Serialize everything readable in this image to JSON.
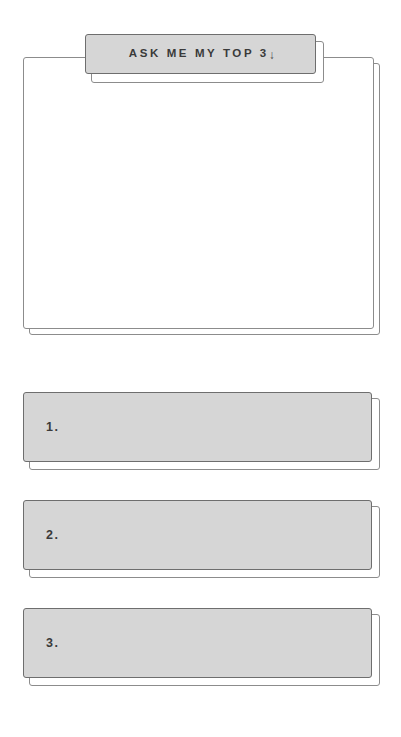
{
  "page": {
    "background_color": "#ffffff",
    "fill_color": "#d6d6d6",
    "border_color": "#6e6e6e",
    "text_color": "#3a3a3a"
  },
  "header_tab": {
    "label": "ASK ME MY TOP 3",
    "arrow_icon": "down-arrow-icon",
    "arrow_glyph": "↓"
  },
  "note_card": {
    "content": ""
  },
  "answer_rows": [
    {
      "number": "1.",
      "value": ""
    },
    {
      "number": "2.",
      "value": ""
    },
    {
      "number": "3.",
      "value": ""
    }
  ]
}
